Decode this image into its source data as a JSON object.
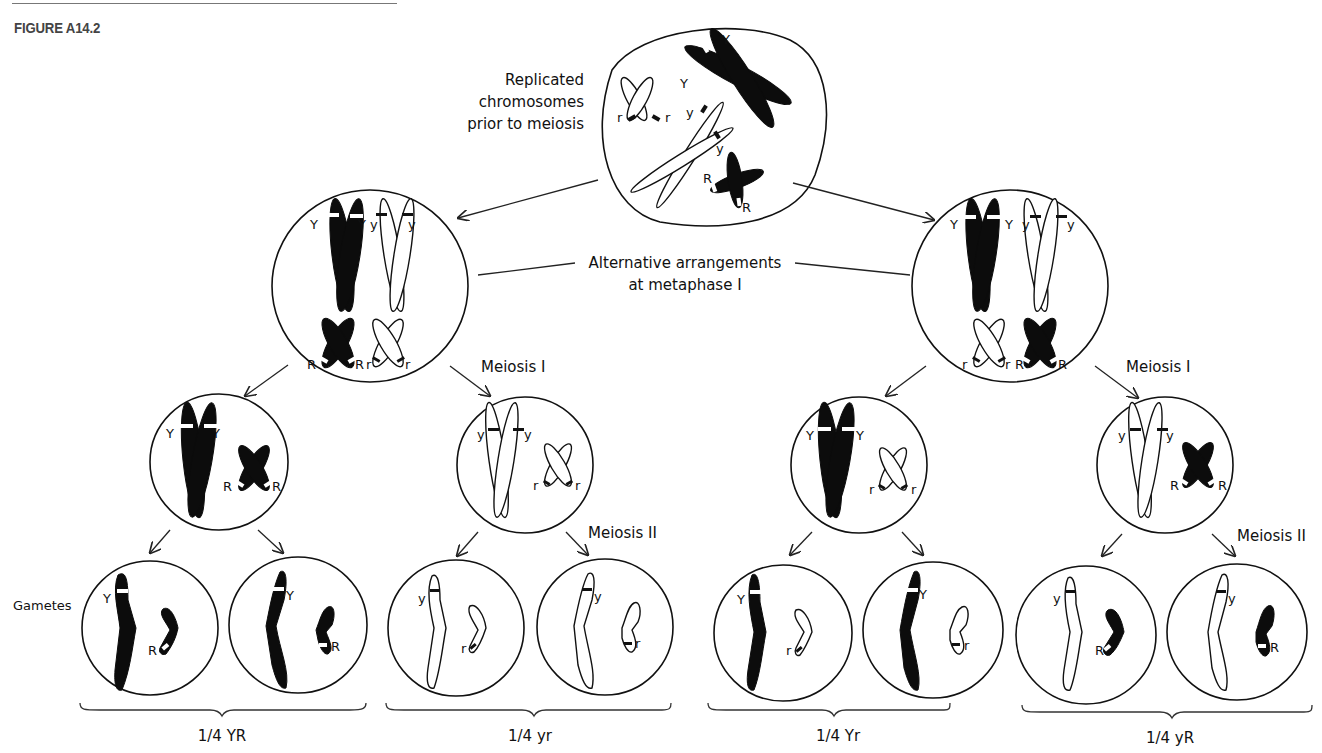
{
  "figure": {
    "title": "FIGURE A14.2"
  },
  "labels": {
    "replicated": [
      "Replicated",
      "chromosomes",
      "prior to meiosis"
    ],
    "alternative": [
      "Alternative arrangements",
      "at metaphase I"
    ],
    "meiosis1_left": "Meiosis I",
    "meiosis1_right": "Meiosis I",
    "meiosis2_left": "Meiosis II",
    "meiosis2_right": "Meiosis II",
    "gametes": "Gametes"
  },
  "gamete_groups": [
    {
      "label": "1/4 YR",
      "genotype": "YR"
    },
    {
      "label": "1/4 yr",
      "genotype": "yr"
    },
    {
      "label": "1/4 Yr",
      "genotype": "Yr"
    },
    {
      "label": "1/4 yR",
      "genotype": "yR"
    }
  ],
  "alleles": {
    "Y": "Y",
    "y": "y",
    "R": "R",
    "r": "r"
  },
  "colors": {
    "dominant_chromosome": "#0c0c0c",
    "recessive_chromosome": "#ffffff",
    "outline": "#111111"
  }
}
